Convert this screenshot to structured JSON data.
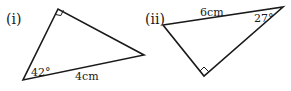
{
  "diagrams": [
    {
      "label": "(i)",
      "vertices": {
        "right_angle": [
          58,
          9
        ],
        "bottom_left": [
          23,
          80
        ],
        "right": [
          144,
          55
        ]
      },
      "angle_label": "42°",
      "side_label": "4cm",
      "right_angle_at": "top"
    },
    {
      "label": "(ii)",
      "vertices": {
        "left": [
          163,
          25
        ],
        "top_right": [
          283,
          7
        ],
        "right_angle": [
          204,
          76
        ]
      },
      "angle_label": "27°",
      "side_label": "6cm",
      "right_angle_at": "bottom"
    }
  ],
  "colors": {
    "ink": "#1a1a1a",
    "background": "#ffffff"
  }
}
